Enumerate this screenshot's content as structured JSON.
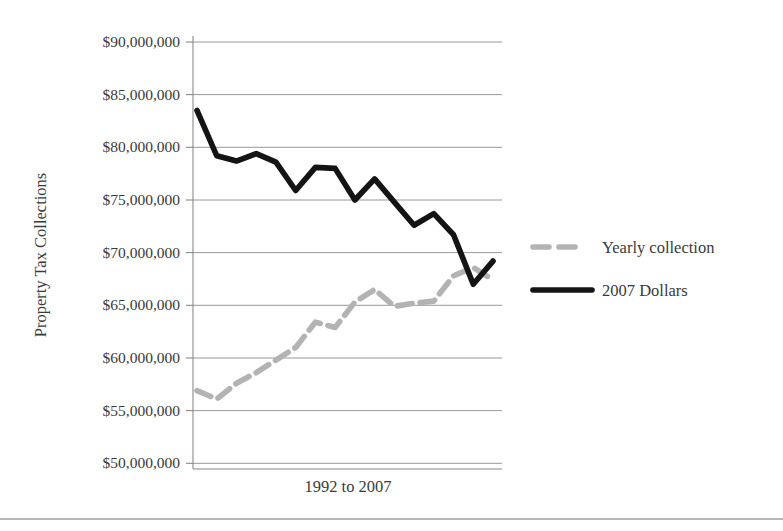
{
  "chart_data": {
    "type": "line",
    "title": "",
    "xlabel": "1992 to 2007",
    "ylabel": "Property Tax Collections",
    "ylim": [
      50000000,
      90000000
    ],
    "ytick_step": 5000000,
    "ytick_labels": [
      "$90,000,000",
      "$85,000,000",
      "$80,000,000",
      "$75,000,000",
      "$70,000,000",
      "$65,000,000",
      "$60,000,000",
      "$55,000,000",
      "$50,000,000"
    ],
    "ytick_values": [
      90000000,
      85000000,
      80000000,
      75000000,
      70000000,
      65000000,
      60000000,
      55000000,
      50000000
    ],
    "grid": true,
    "grid_axis": "y",
    "legend_position": "right",
    "x": [
      1992,
      1993,
      1994,
      1995,
      1996,
      1997,
      1998,
      1999,
      2000,
      2001,
      2002,
      2003,
      2004,
      2005,
      2006,
      2007
    ],
    "xtick_labels": [],
    "series": [
      {
        "name": "Yearly collection",
        "style": "dashed",
        "color": "#b3b3b3",
        "values": [
          56900000,
          56100000,
          57600000,
          58600000,
          59800000,
          61000000,
          63400000,
          62900000,
          65300000,
          66500000,
          64900000,
          65200000,
          65400000,
          67800000,
          68600000,
          67400000
        ]
      },
      {
        "name": "2007 Dollars",
        "style": "solid",
        "color": "#141414",
        "values": [
          83500000,
          79200000,
          78700000,
          79400000,
          78600000,
          75900000,
          78100000,
          78000000,
          75000000,
          77000000,
          74800000,
          72600000,
          73700000,
          71700000,
          67000000,
          69200000
        ]
      }
    ]
  },
  "legend": {
    "entries": [
      {
        "label": "Yearly collection",
        "swatch": "dashed-gray-line-swatch"
      },
      {
        "label": "2007 Dollars",
        "swatch": "solid-black-line-swatch"
      }
    ]
  },
  "axes": {
    "y_title": "Property Tax Collections",
    "x_title": "1992 to 2007"
  },
  "colors": {
    "series_yearly": "#b3b3b3",
    "series_2007": "#141414",
    "grid": "#8d8d8d",
    "text": "#3a3a3a",
    "background": "#ffffff"
  }
}
